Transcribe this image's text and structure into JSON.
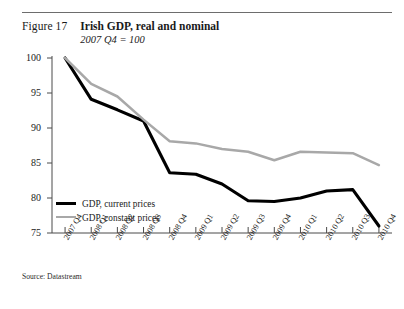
{
  "figure": {
    "number": "Figure 17",
    "title": "Irish GDP, real and nominal",
    "subtitle": "2007 Q4 = 100",
    "source": "Source: Datastream"
  },
  "legend": {
    "items": [
      {
        "label": "GDP, current prices",
        "color": "#000000"
      },
      {
        "label": "GDP, constant prices",
        "color": "#a8a8a8"
      }
    ]
  },
  "chart_data": {
    "type": "line",
    "title": "Irish GDP, real and nominal",
    "subtitle": "2007 Q4 = 100",
    "xlabel": "",
    "ylabel": "",
    "ylim": [
      75,
      100
    ],
    "yticks": [
      75,
      80,
      85,
      90,
      95,
      100
    ],
    "grid": false,
    "legend_position": "inside-bottom-left",
    "categories": [
      "2007 Q4",
      "2008 Q1",
      "2008 Q2",
      "2008 Q3",
      "2008 Q4",
      "2009 Q1",
      "2009 Q2",
      "2009 Q3",
      "2009 Q4",
      "2010 Q1",
      "2010 Q2",
      "2010 Q3",
      "2010 Q4"
    ],
    "series": [
      {
        "name": "GDP, current prices",
        "color": "#000000",
        "values": [
          100.0,
          94.1,
          92.6,
          91.0,
          83.6,
          83.4,
          82.0,
          79.6,
          79.5,
          80.0,
          81.0,
          81.2,
          76.0
        ]
      },
      {
        "name": "GDP, constant prices",
        "color": "#a8a8a8",
        "values": [
          100.0,
          96.3,
          94.5,
          91.2,
          88.1,
          87.8,
          87.0,
          86.6,
          85.4,
          86.6,
          86.5,
          86.4,
          84.7
        ]
      }
    ]
  }
}
